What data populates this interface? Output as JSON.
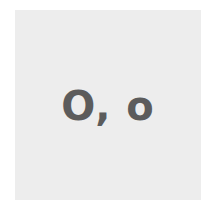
{
  "card": {
    "text": "O, o",
    "background_color": "#ededed",
    "text_color": "#5c5c5c"
  }
}
